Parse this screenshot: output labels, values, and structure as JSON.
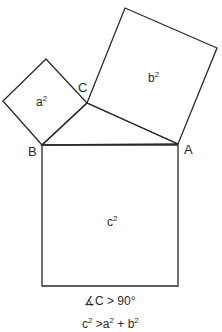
{
  "diagram": {
    "vertices": {
      "A": {
        "label": "A",
        "x": 178,
        "y": 144
      },
      "B": {
        "label": "B",
        "x": 42,
        "y": 145
      },
      "C": {
        "label": "C",
        "x": 87,
        "y": 103
      }
    },
    "squares": {
      "a": {
        "base": "a",
        "exp": "2",
        "points": "42,145 87,103 46,59 3,101"
      },
      "b": {
        "base": "b",
        "exp": "2",
        "points": "87,103 125,8 217,48 178,144"
      },
      "c": {
        "base": "c",
        "exp": "2",
        "points": "42,145 178,145 178,286 42,286"
      }
    },
    "triangle": {
      "points": "42,145 87,103 178,144"
    },
    "captions": {
      "angle": "∡C > 90°",
      "inequality": {
        "c_base": "c",
        "c_exp": "2",
        "op": " >",
        "a_base": "a",
        "a_exp": "2",
        "plus": " + ",
        "b_base": "b",
        "b_exp": "2"
      }
    },
    "colors": {
      "stroke": "#2a2a2a",
      "background": "#ffffff"
    }
  }
}
